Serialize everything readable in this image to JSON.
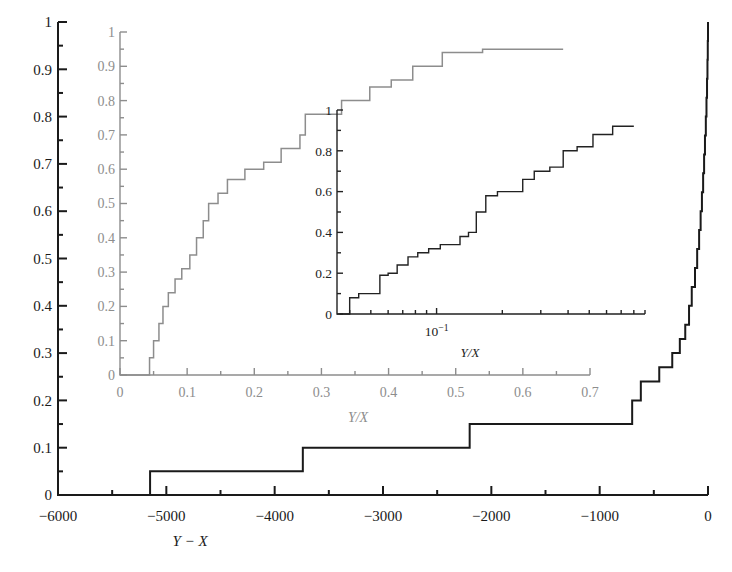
{
  "figure": {
    "background": "#ffffff",
    "main_color": "#1a1a1a",
    "middle_color": "#8d8d8d",
    "inner_color": "#222222"
  },
  "chart_data": [
    {
      "id": "main",
      "type": "line",
      "step": "post",
      "title": "",
      "xlabel": "Y − X",
      "ylabel": "",
      "xlim": [
        -6000,
        0
      ],
      "ylim": [
        0,
        1
      ],
      "xticks": [
        -6000,
        -5000,
        -4000,
        -3000,
        -2000,
        -1000,
        0
      ],
      "xticklabels": [
        "−6000",
        "−5000",
        "−4000",
        "−3000",
        "−2000",
        "−1000",
        "0"
      ],
      "xminorticks": [
        -5500,
        -4500,
        -3500,
        -2500,
        -1500,
        -500
      ],
      "yticks": [
        0,
        0.1,
        0.2,
        0.3,
        0.4,
        0.5,
        0.6,
        0.7,
        0.8,
        0.9,
        1
      ],
      "yticklabels": [
        "0",
        "0.1",
        "0.2",
        "0.3",
        "0.4",
        "0.5",
        "0.6",
        "0.7",
        "0.8",
        "0.9",
        "1"
      ],
      "yminorticks": [
        0.05,
        0.15,
        0.25,
        0.35,
        0.45,
        0.55,
        0.65,
        0.75,
        0.85,
        0.95
      ],
      "grid": false,
      "legend": "none",
      "x": [
        -6000,
        -5150,
        -3740,
        -2200,
        -700,
        -620,
        -450,
        -330,
        -260,
        -210,
        -175,
        -150,
        -120,
        -100,
        -82,
        -68,
        -56,
        -45,
        -36,
        -28,
        -20,
        -14,
        -9,
        -5,
        -2,
        0
      ],
      "y": [
        0.0,
        0.05,
        0.1,
        0.15,
        0.2,
        0.24,
        0.27,
        0.3,
        0.33,
        0.36,
        0.4,
        0.44,
        0.48,
        0.52,
        0.56,
        0.6,
        0.64,
        0.68,
        0.72,
        0.76,
        0.8,
        0.84,
        0.88,
        0.92,
        0.96,
        1.0
      ]
    },
    {
      "id": "middle",
      "type": "line",
      "step": "post",
      "title": "",
      "xlabel": "Y/X",
      "ylabel": "",
      "xlim": [
        0,
        0.7
      ],
      "ylim": [
        0,
        1
      ],
      "xticks": [
        0,
        0.1,
        0.2,
        0.3,
        0.4,
        0.5,
        0.6,
        0.7
      ],
      "xticklabels": [
        "0",
        "0.1",
        "0.2",
        "0.3",
        "0.4",
        "0.5",
        "0.6",
        "0.7"
      ],
      "xminorticks": [
        0.05,
        0.15,
        0.25,
        0.35,
        0.45,
        0.55,
        0.65
      ],
      "yticks": [
        0,
        0.1,
        0.2,
        0.3,
        0.4,
        0.5,
        0.6,
        0.7,
        0.8,
        0.9,
        1
      ],
      "yticklabels": [
        "0",
        "0.1",
        "0.2",
        "0.3",
        "0.4",
        "0.5",
        "0.6",
        "0.7",
        "0.8",
        "0.9",
        "1"
      ],
      "yminorticks": [
        0.05,
        0.15,
        0.25,
        0.35,
        0.45,
        0.55,
        0.65,
        0.75,
        0.85,
        0.95
      ],
      "grid": false,
      "legend": "none",
      "x": [
        0.0,
        0.041,
        0.044,
        0.05,
        0.058,
        0.064,
        0.072,
        0.082,
        0.092,
        0.104,
        0.114,
        0.124,
        0.132,
        0.146,
        0.16,
        0.186,
        0.214,
        0.24,
        0.268,
        0.276,
        0.33,
        0.372,
        0.404,
        0.436,
        0.48,
        0.54,
        0.66
      ],
      "y": [
        0.0,
        0.0,
        0.05,
        0.1,
        0.15,
        0.2,
        0.24,
        0.28,
        0.31,
        0.35,
        0.4,
        0.45,
        0.5,
        0.53,
        0.57,
        0.6,
        0.62,
        0.66,
        0.7,
        0.76,
        0.8,
        0.84,
        0.86,
        0.9,
        0.94,
        0.95,
        0.95
      ]
    },
    {
      "id": "inner",
      "type": "line",
      "step": "post",
      "title": "",
      "xlabel": "Y/X",
      "ylabel": "",
      "xscale": "log",
      "xlim": [
        0.035,
        0.9
      ],
      "ylim": [
        0,
        1
      ],
      "xticks": [
        0.1
      ],
      "xticklabels": [
        "10⁻¹"
      ],
      "xminorticks": [
        0.04,
        0.05,
        0.06,
        0.07,
        0.08,
        0.09,
        0.2,
        0.3,
        0.4,
        0.5,
        0.6,
        0.7,
        0.8,
        0.9
      ],
      "yticks": [
        0,
        0.2,
        0.4,
        0.6,
        0.8,
        1
      ],
      "yticklabels": [
        "0",
        "0.2",
        "0.4",
        "0.6",
        "0.8",
        "1"
      ],
      "yminorticks": [
        0.1,
        0.3,
        0.5,
        0.7,
        0.9
      ],
      "grid": false,
      "legend": "none",
      "x": [
        0.036,
        0.04,
        0.044,
        0.05,
        0.055,
        0.06,
        0.066,
        0.074,
        0.082,
        0.092,
        0.104,
        0.116,
        0.128,
        0.14,
        0.152,
        0.168,
        0.19,
        0.216,
        0.248,
        0.28,
        0.33,
        0.38,
        0.44,
        0.52,
        0.64,
        0.8
      ],
      "y": [
        0.0,
        0.08,
        0.1,
        0.1,
        0.19,
        0.2,
        0.24,
        0.28,
        0.3,
        0.32,
        0.34,
        0.34,
        0.38,
        0.4,
        0.5,
        0.58,
        0.6,
        0.6,
        0.66,
        0.7,
        0.72,
        0.8,
        0.82,
        0.88,
        0.92,
        0.92
      ]
    }
  ],
  "axes_titles": {
    "main_x": "Y − X",
    "middle_x": "Y/X",
    "inner_x": "Y/X"
  }
}
